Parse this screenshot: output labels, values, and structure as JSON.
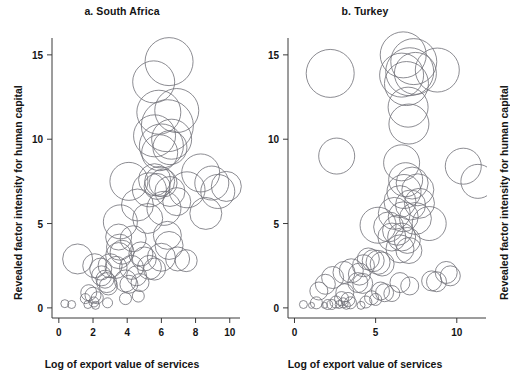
{
  "figure": {
    "shared_ylabel": "Revealed factor intensity for human capital",
    "shared_xlabel": "Log of export value of services",
    "bubble_stroke_color": "#6e6e76",
    "axis_color": "#3a3a3a",
    "background_color": "#ffffff"
  },
  "panels": [
    {
      "id": "a",
      "title": "a. South Africa"
    },
    {
      "id": "b",
      "title": "b. Turkey"
    }
  ],
  "chart_data": [
    {
      "type": "scatter",
      "title": "a. South Africa",
      "xlabel": "Log of export value of services",
      "ylabel": "Revealed factor intensity for human capital",
      "xlim": [
        -0.4,
        10.6
      ],
      "ylim": [
        -0.6,
        16.0
      ],
      "xticks": [
        0,
        2,
        4,
        6,
        8,
        10
      ],
      "xticklabels": [
        "0",
        "2",
        "4",
        "6",
        "8",
        "10"
      ],
      "yticks": [
        0,
        5,
        10,
        15
      ],
      "yticklabels": [
        "0",
        "5",
        "10",
        "15"
      ],
      "grid": false,
      "legend": "none",
      "marker": "open-circle",
      "size_encodes": "bubble size (third variable)",
      "points": [
        {
          "x": 6.45,
          "y": 14.6,
          "r": 24
        },
        {
          "x": 5.55,
          "y": 13.4,
          "r": 21
        },
        {
          "x": 6.9,
          "y": 11.7,
          "r": 22
        },
        {
          "x": 5.85,
          "y": 11.6,
          "r": 22
        },
        {
          "x": 6.35,
          "y": 10.8,
          "r": 26
        },
        {
          "x": 5.6,
          "y": 10.2,
          "r": 21
        },
        {
          "x": 6.6,
          "y": 10.0,
          "r": 20
        },
        {
          "x": 6.0,
          "y": 9.6,
          "r": 22
        },
        {
          "x": 5.9,
          "y": 9.2,
          "r": 18
        },
        {
          "x": 6.5,
          "y": 9.5,
          "r": 17
        },
        {
          "x": 8.3,
          "y": 8.0,
          "r": 19
        },
        {
          "x": 8.95,
          "y": 7.4,
          "r": 17
        },
        {
          "x": 4.1,
          "y": 7.5,
          "r": 19
        },
        {
          "x": 5.6,
          "y": 7.6,
          "r": 16
        },
        {
          "x": 5.9,
          "y": 7.5,
          "r": 15
        },
        {
          "x": 6.1,
          "y": 7.4,
          "r": 14
        },
        {
          "x": 5.75,
          "y": 7.2,
          "r": 13
        },
        {
          "x": 5.3,
          "y": 7.0,
          "r": 17
        },
        {
          "x": 6.5,
          "y": 6.9,
          "r": 15
        },
        {
          "x": 7.5,
          "y": 7.0,
          "r": 18
        },
        {
          "x": 9.3,
          "y": 6.9,
          "r": 17
        },
        {
          "x": 9.8,
          "y": 7.2,
          "r": 15
        },
        {
          "x": 6.9,
          "y": 6.3,
          "r": 14
        },
        {
          "x": 4.6,
          "y": 6.1,
          "r": 16
        },
        {
          "x": 6.15,
          "y": 5.9,
          "r": 17
        },
        {
          "x": 8.6,
          "y": 5.6,
          "r": 16
        },
        {
          "x": 3.6,
          "y": 5.1,
          "r": 17
        },
        {
          "x": 5.2,
          "y": 5.3,
          "r": 15
        },
        {
          "x": 4.35,
          "y": 4.1,
          "r": 13
        },
        {
          "x": 3.5,
          "y": 4.2,
          "r": 13
        },
        {
          "x": 6.35,
          "y": 4.3,
          "r": 14
        },
        {
          "x": 6.45,
          "y": 3.7,
          "r": 14
        },
        {
          "x": 3.55,
          "y": 3.6,
          "r": 13
        },
        {
          "x": 3.7,
          "y": 3.3,
          "r": 12
        },
        {
          "x": 3.5,
          "y": 3.1,
          "r": 13
        },
        {
          "x": 4.8,
          "y": 3.2,
          "r": 12
        },
        {
          "x": 5.0,
          "y": 2.9,
          "r": 12
        },
        {
          "x": 6.0,
          "y": 3.0,
          "r": 14
        },
        {
          "x": 6.95,
          "y": 2.9,
          "r": 12
        },
        {
          "x": 7.45,
          "y": 2.8,
          "r": 11
        },
        {
          "x": 1.1,
          "y": 2.9,
          "r": 15
        },
        {
          "x": 2.1,
          "y": 2.5,
          "r": 12
        },
        {
          "x": 2.45,
          "y": 2.3,
          "r": 11
        },
        {
          "x": 3.0,
          "y": 2.5,
          "r": 12
        },
        {
          "x": 3.35,
          "y": 2.4,
          "r": 11
        },
        {
          "x": 4.25,
          "y": 2.4,
          "r": 12
        },
        {
          "x": 5.3,
          "y": 2.4,
          "r": 12
        },
        {
          "x": 5.6,
          "y": 2.3,
          "r": 11
        },
        {
          "x": 2.5,
          "y": 1.9,
          "r": 10
        },
        {
          "x": 2.7,
          "y": 1.7,
          "r": 9
        },
        {
          "x": 2.8,
          "y": 1.5,
          "r": 10
        },
        {
          "x": 2.9,
          "y": 1.3,
          "r": 9
        },
        {
          "x": 3.9,
          "y": 1.6,
          "r": 11
        },
        {
          "x": 4.1,
          "y": 1.4,
          "r": 9
        },
        {
          "x": 4.55,
          "y": 1.9,
          "r": 10
        },
        {
          "x": 4.75,
          "y": 1.5,
          "r": 9
        },
        {
          "x": 1.75,
          "y": 0.9,
          "r": 8
        },
        {
          "x": 2.0,
          "y": 0.75,
          "r": 8
        },
        {
          "x": 2.25,
          "y": 0.6,
          "r": 6
        },
        {
          "x": 1.55,
          "y": 0.55,
          "r": 5
        },
        {
          "x": 2.05,
          "y": 0.35,
          "r": 5
        },
        {
          "x": 2.85,
          "y": 0.3,
          "r": 5
        },
        {
          "x": 3.9,
          "y": 0.55,
          "r": 6
        },
        {
          "x": 4.65,
          "y": 0.7,
          "r": 6
        },
        {
          "x": 0.35,
          "y": 0.25,
          "r": 4
        },
        {
          "x": 0.75,
          "y": 0.2,
          "r": 4
        },
        {
          "x": 1.7,
          "y": 0.2,
          "r": 4
        },
        {
          "x": 2.15,
          "y": 0.15,
          "r": 4
        }
      ]
    },
    {
      "type": "scatter",
      "title": "b. Turkey",
      "xlabel": "Log of export value of services",
      "ylabel": "Revealed factor intensity for human capital",
      "xlim": [
        -0.4,
        11.8
      ],
      "ylim": [
        -0.6,
        16.0
      ],
      "xticks": [
        0,
        5,
        10
      ],
      "xticklabels": [
        "0",
        "5",
        "10"
      ],
      "yticks": [
        0,
        5,
        10,
        15
      ],
      "yticklabels": [
        "0",
        "5",
        "10",
        "15"
      ],
      "grid": false,
      "legend": "none",
      "marker": "open-circle",
      "size_encodes": "bubble size (third variable)",
      "points": [
        {
          "x": 6.7,
          "y": 15.0,
          "r": 23
        },
        {
          "x": 7.35,
          "y": 14.6,
          "r": 23
        },
        {
          "x": 7.1,
          "y": 14.0,
          "r": 24
        },
        {
          "x": 6.6,
          "y": 13.8,
          "r": 22
        },
        {
          "x": 7.45,
          "y": 13.9,
          "r": 21
        },
        {
          "x": 6.9,
          "y": 13.3,
          "r": 22
        },
        {
          "x": 8.8,
          "y": 14.1,
          "r": 22
        },
        {
          "x": 2.2,
          "y": 13.9,
          "r": 24
        },
        {
          "x": 7.0,
          "y": 11.9,
          "r": 20
        },
        {
          "x": 7.05,
          "y": 10.9,
          "r": 20
        },
        {
          "x": 2.6,
          "y": 9.0,
          "r": 18
        },
        {
          "x": 6.6,
          "y": 8.6,
          "r": 18
        },
        {
          "x": 10.4,
          "y": 8.4,
          "r": 18
        },
        {
          "x": 6.85,
          "y": 7.6,
          "r": 17
        },
        {
          "x": 7.25,
          "y": 7.4,
          "r": 16
        },
        {
          "x": 6.75,
          "y": 6.9,
          "r": 17
        },
        {
          "x": 7.6,
          "y": 7.0,
          "r": 16
        },
        {
          "x": 11.3,
          "y": 7.5,
          "r": 17
        },
        {
          "x": 6.5,
          "y": 6.3,
          "r": 16
        },
        {
          "x": 7.15,
          "y": 6.1,
          "r": 15
        },
        {
          "x": 7.7,
          "y": 6.2,
          "r": 15
        },
        {
          "x": 6.15,
          "y": 5.6,
          "r": 16
        },
        {
          "x": 6.7,
          "y": 5.4,
          "r": 15
        },
        {
          "x": 7.45,
          "y": 5.3,
          "r": 16
        },
        {
          "x": 8.3,
          "y": 5.0,
          "r": 17
        },
        {
          "x": 5.15,
          "y": 4.9,
          "r": 18
        },
        {
          "x": 5.8,
          "y": 4.8,
          "r": 15
        },
        {
          "x": 6.35,
          "y": 4.6,
          "r": 15
        },
        {
          "x": 6.0,
          "y": 4.2,
          "r": 14
        },
        {
          "x": 6.6,
          "y": 4.2,
          "r": 14
        },
        {
          "x": 6.95,
          "y": 4.0,
          "r": 13
        },
        {
          "x": 6.5,
          "y": 3.5,
          "r": 14
        },
        {
          "x": 7.05,
          "y": 3.4,
          "r": 13
        },
        {
          "x": 4.55,
          "y": 2.9,
          "r": 11
        },
        {
          "x": 4.85,
          "y": 2.8,
          "r": 11
        },
        {
          "x": 5.15,
          "y": 2.7,
          "r": 12
        },
        {
          "x": 5.4,
          "y": 2.6,
          "r": 12
        },
        {
          "x": 4.25,
          "y": 2.5,
          "r": 11
        },
        {
          "x": 3.5,
          "y": 2.2,
          "r": 12
        },
        {
          "x": 3.05,
          "y": 2.1,
          "r": 11
        },
        {
          "x": 4.0,
          "y": 2.0,
          "r": 11
        },
        {
          "x": 2.35,
          "y": 1.8,
          "r": 11
        },
        {
          "x": 9.35,
          "y": 2.1,
          "r": 11
        },
        {
          "x": 9.6,
          "y": 1.9,
          "r": 10
        },
        {
          "x": 8.45,
          "y": 1.6,
          "r": 10
        },
        {
          "x": 8.75,
          "y": 1.55,
          "r": 10
        },
        {
          "x": 1.9,
          "y": 1.4,
          "r": 10
        },
        {
          "x": 3.9,
          "y": 1.5,
          "r": 10
        },
        {
          "x": 4.2,
          "y": 1.45,
          "r": 10
        },
        {
          "x": 6.5,
          "y": 1.5,
          "r": 10
        },
        {
          "x": 7.1,
          "y": 1.3,
          "r": 9
        },
        {
          "x": 1.5,
          "y": 1.0,
          "r": 9
        },
        {
          "x": 3.1,
          "y": 0.9,
          "r": 9
        },
        {
          "x": 5.3,
          "y": 1.0,
          "r": 9
        },
        {
          "x": 5.55,
          "y": 0.9,
          "r": 9
        },
        {
          "x": 6.0,
          "y": 0.85,
          "r": 8
        },
        {
          "x": 2.9,
          "y": 0.55,
          "r": 7
        },
        {
          "x": 3.3,
          "y": 0.5,
          "r": 7
        },
        {
          "x": 4.75,
          "y": 0.6,
          "r": 7
        },
        {
          "x": 5.0,
          "y": 0.5,
          "r": 6
        },
        {
          "x": 2.55,
          "y": 0.35,
          "r": 6
        },
        {
          "x": 3.0,
          "y": 0.3,
          "r": 5
        },
        {
          "x": 3.45,
          "y": 0.3,
          "r": 6
        },
        {
          "x": 4.4,
          "y": 0.35,
          "r": 6
        },
        {
          "x": 1.35,
          "y": 0.3,
          "r": 6
        },
        {
          "x": 2.05,
          "y": 0.2,
          "r": 5
        },
        {
          "x": 2.3,
          "y": 0.2,
          "r": 5
        },
        {
          "x": 2.75,
          "y": 0.2,
          "r": 4
        },
        {
          "x": 3.2,
          "y": 0.15,
          "r": 4
        },
        {
          "x": 0.55,
          "y": 0.2,
          "r": 4
        },
        {
          "x": 1.05,
          "y": 0.15,
          "r": 3
        },
        {
          "x": 1.85,
          "y": 0.15,
          "r": 3
        },
        {
          "x": 4.1,
          "y": 0.15,
          "r": 4
        }
      ]
    }
  ]
}
